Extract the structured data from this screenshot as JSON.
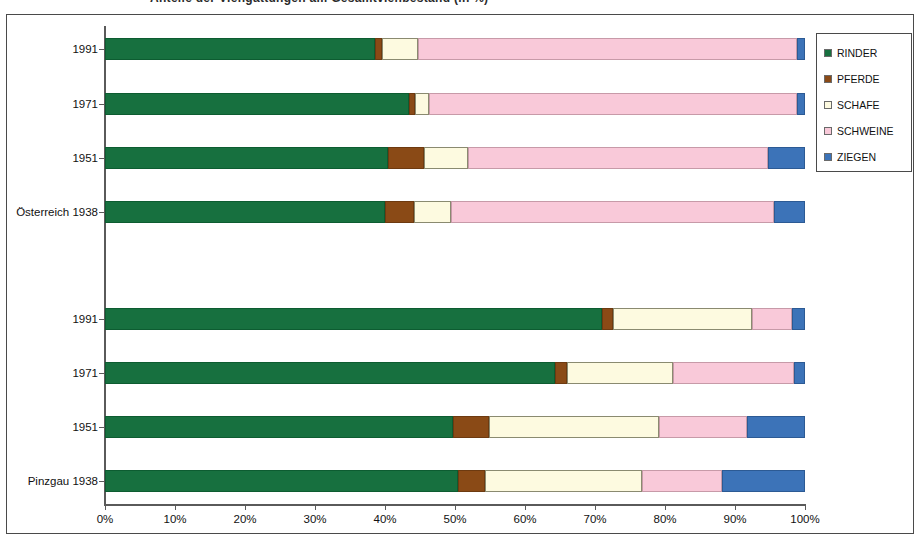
{
  "title": "Anteile der Viehgattungen am Gesamtviehbestand (in %)",
  "legend": {
    "position": "right",
    "items": [
      {
        "label": "RINDER",
        "color": "#17703f",
        "icon": "legend-swatch-icon"
      },
      {
        "label": "PFERDE",
        "color": "#8a4a16",
        "icon": "legend-swatch-icon"
      },
      {
        "label": "SCHAFE",
        "color": "#fdfae0",
        "icon": "legend-swatch-icon"
      },
      {
        "label": "SCHWEINE",
        "color": "#f9c9d9",
        "icon": "legend-swatch-icon"
      },
      {
        "label": "ZIEGEN",
        "color": "#3c73b8",
        "icon": "legend-swatch-icon"
      }
    ]
  },
  "axis": {
    "x_ticks": [
      "0%",
      "10%",
      "20%",
      "30%",
      "40%",
      "50%",
      "60%",
      "70%",
      "80%",
      "90%",
      "100%"
    ],
    "x_min": 0,
    "x_max": 100,
    "y_categories": [
      "1991",
      "1971",
      "1951",
      "Österreich 1938",
      "1991",
      "1971",
      "1951",
      "Pinzgau 1938"
    ]
  },
  "chart_data": {
    "type": "bar",
    "orientation": "horizontal",
    "stacked": true,
    "stack_mode": "percent",
    "title": "Anteile der Viehgattungen am Gesamtviehbestand (in %)",
    "xlabel": "",
    "ylabel": "",
    "xlim": [
      0,
      100
    ],
    "grid": false,
    "legend_position": "right",
    "categories": [
      "1991",
      "1971",
      "1951",
      "Österreich 1938",
      "1991",
      "1971",
      "1951",
      "Pinzgau 1938"
    ],
    "groups": [
      {
        "name": "Österreich",
        "categories": [
          "1991",
          "1971",
          "1951",
          "Österreich 1938"
        ]
      },
      {
        "name": "Pinzgau",
        "categories": [
          "1991",
          "1971",
          "1951",
          "Pinzgau 1938"
        ]
      }
    ],
    "series": [
      {
        "name": "RINDER",
        "color": "#17703f",
        "values": [
          38.6,
          43.4,
          40.4,
          40.0,
          71.0,
          64.3,
          49.7,
          50.4
        ]
      },
      {
        "name": "PFERDE",
        "color": "#8a4a16",
        "values": [
          1.0,
          0.9,
          5.2,
          4.1,
          1.6,
          1.7,
          5.2,
          3.9
        ]
      },
      {
        "name": "SCHAFE",
        "color": "#fdfae0",
        "values": [
          5.1,
          2.0,
          6.3,
          5.3,
          19.8,
          15.1,
          24.2,
          22.4
        ]
      },
      {
        "name": "SCHWEINE",
        "color": "#f9c9d9",
        "values": [
          54.2,
          52.6,
          42.8,
          46.2,
          5.7,
          17.3,
          12.6,
          11.4
        ]
      },
      {
        "name": "ZIEGEN",
        "color": "#3c73b8",
        "values": [
          1.1,
          1.1,
          5.3,
          4.4,
          1.9,
          1.6,
          8.3,
          11.9
        ]
      }
    ]
  }
}
